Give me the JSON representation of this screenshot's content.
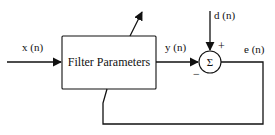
{
  "diagram": {
    "type": "adaptive-filter-block-diagram",
    "block": {
      "label": "Filter Parameters"
    },
    "summing_junction": {
      "symbol": "Σ",
      "plus_sign": "+",
      "minus_sign": "−"
    },
    "signals": {
      "input": "x (n)",
      "output": "y (n)",
      "desired": "d (n)",
      "error": "e (n)"
    },
    "colors": {
      "stroke": "#111111",
      "background": "#ffffff"
    }
  }
}
